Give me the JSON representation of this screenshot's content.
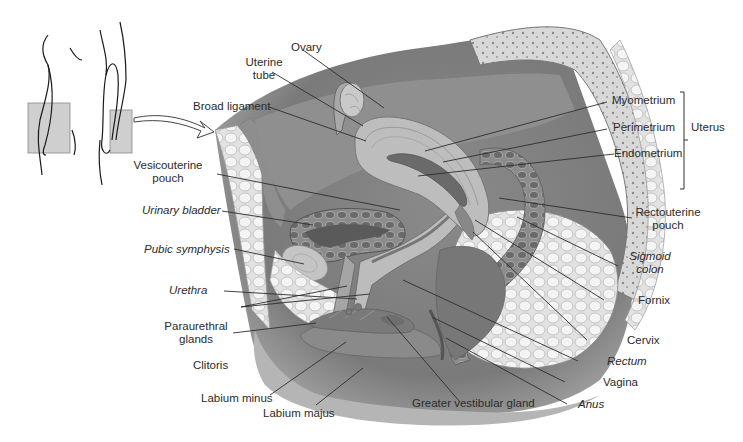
{
  "figure": {
    "locator": {
      "label": "locator-figure"
    }
  },
  "labels": {
    "ovary": "Ovary",
    "uterine_tube_1": "Uterine",
    "uterine_tube_2": "tube",
    "broad_ligament": "Broad ligament",
    "vesicouterine_1": "Vesicouterine",
    "vesicouterine_2": "pouch",
    "urinary_bladder": "Urinary bladder",
    "pubic_symphysis": "Pubic symphysis",
    "urethra": "Urethra",
    "paraurethral_1": "Paraurethral",
    "paraurethral_2": "glands",
    "clitoris": "Clitoris",
    "labium_minus": "Labium minus",
    "labium_majus": "Labium majus",
    "greater_vestibular_gland": "Greater vestibular gland",
    "anus": "Anus",
    "vagina": "Vagina",
    "rectum": "Rectum",
    "cervix": "Cervix",
    "fornix": "Fornix",
    "sigmoid_1": "Sigmoid",
    "sigmoid_2": "colon",
    "rectouterine_1": "Rectouterine",
    "rectouterine_2": "pouch",
    "myometrium": "Myometrium",
    "perimetrium": "Perimetrium",
    "endometrium": "Endometrium",
    "uterus": "Uterus"
  },
  "colors": {
    "tissue_dark": "#6e6e6e",
    "tissue_mid": "#9a9a9a",
    "tissue_light": "#c9c9c9",
    "fat": "#e4e4e4",
    "leader": "#333333"
  }
}
